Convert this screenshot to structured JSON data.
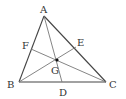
{
  "diagram": {
    "type": "triangle-medians",
    "colors": {
      "line": "#444444",
      "median": "#777777",
      "text": "#333333",
      "point": "#111111"
    },
    "vertices": {
      "A": {
        "label": "A",
        "x": 44,
        "y": 16,
        "lx": 40,
        "ly": 13
      },
      "B": {
        "label": "B",
        "x": 19,
        "y": 82,
        "lx": 7,
        "ly": 88
      },
      "C": {
        "label": "C",
        "x": 106,
        "y": 82,
        "lx": 109,
        "ly": 88
      }
    },
    "points": {
      "D": {
        "label": "D",
        "x": 62,
        "y": 82,
        "lx": 59,
        "ly": 96
      },
      "E": {
        "label": "E",
        "x": 76,
        "y": 47,
        "lx": 77,
        "ly": 46
      },
      "F": {
        "label": "F",
        "x": 31,
        "y": 49,
        "lx": 22,
        "ly": 49
      },
      "G": {
        "label": "G",
        "x": 57,
        "y": 60,
        "lx": 51,
        "ly": 74
      }
    }
  }
}
